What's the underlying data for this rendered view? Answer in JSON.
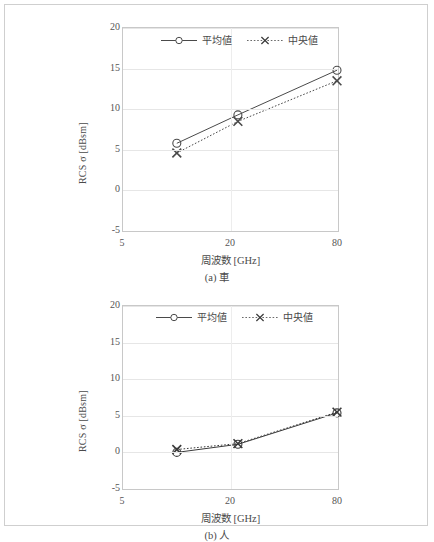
{
  "figure": {
    "panels": [
      {
        "id": "a",
        "caption": "(a) 車",
        "chart": {
          "type": "line",
          "title": "",
          "xlabel": "周波数 [GHz]",
          "ylabel": "RCS σ [dBsm]",
          "x_ticklabels": [
            "5",
            "20",
            "80"
          ],
          "x_tickvalues": [
            5,
            20,
            80
          ],
          "y_ticklabels": [
            "20",
            "15",
            "10",
            "5",
            "0",
            "-5"
          ],
          "y_tickvalues": [
            20,
            15,
            10,
            5,
            0,
            -5
          ],
          "xlim": [
            5,
            80
          ],
          "ylim": [
            -5,
            20
          ],
          "x_scale": "log",
          "grid": "horizontal",
          "legend_position": "top-center",
          "x": [
            10,
            22,
            79
          ],
          "series": [
            {
              "name": "平均値",
              "marker": "circle",
              "line": "solid",
              "color": "#4a4a4a",
              "values": [
                5.8,
                9.3,
                14.8
              ]
            },
            {
              "name": "中央値",
              "marker": "cross",
              "line": "dotted",
              "color": "#4a4a4a",
              "values": [
                4.6,
                8.5,
                13.5
              ]
            }
          ]
        }
      },
      {
        "id": "b",
        "caption": "(b) 人",
        "chart": {
          "type": "line",
          "title": "",
          "xlabel": "周波数 [GHz]",
          "ylabel": "RCS σ [dBsm]",
          "x_ticklabels": [
            "5",
            "20",
            "80"
          ],
          "x_tickvalues": [
            5,
            20,
            80
          ],
          "y_ticklabels": [
            "20",
            "15",
            "10",
            "5",
            "0",
            "-5"
          ],
          "y_tickvalues": [
            20,
            15,
            10,
            5,
            0,
            -5
          ],
          "xlim": [
            5,
            80
          ],
          "ylim": [
            -5,
            20
          ],
          "x_scale": "log",
          "grid": "horizontal",
          "legend_position": "top-center",
          "x": [
            10,
            22,
            79
          ],
          "series": [
            {
              "name": "平均値",
              "marker": "circle",
              "line": "solid",
              "color": "#3a3a3a",
              "values": [
                0.0,
                1.1,
                5.4
              ]
            },
            {
              "name": "中央値",
              "marker": "cross",
              "line": "dotted",
              "color": "#3a3a3a",
              "values": [
                0.4,
                1.2,
                5.5
              ]
            }
          ]
        }
      }
    ]
  },
  "chart_data": [
    {
      "type": "line",
      "title": "(a) 車",
      "xlabel": "周波数 [GHz]",
      "ylabel": "RCS σ [dBsm]",
      "categories": [
        "10",
        "22",
        "79"
      ],
      "x": [
        10,
        22,
        79
      ],
      "xlim": [
        5,
        80
      ],
      "ylim": [
        -5,
        20
      ],
      "xticks": [
        5,
        20,
        80
      ],
      "yticks": [
        20,
        15,
        10,
        5,
        0,
        -5
      ],
      "grid": true,
      "legend_position": "top-center",
      "series": [
        {
          "name": "平均値",
          "values": [
            5.8,
            9.3,
            14.8
          ]
        },
        {
          "name": "中央値",
          "values": [
            4.6,
            8.5,
            13.5
          ]
        }
      ]
    },
    {
      "type": "line",
      "title": "(b) 人",
      "xlabel": "周波数 [GHz]",
      "ylabel": "RCS σ [dBsm]",
      "categories": [
        "10",
        "22",
        "79"
      ],
      "x": [
        10,
        22,
        79
      ],
      "xlim": [
        5,
        80
      ],
      "ylim": [
        -5,
        20
      ],
      "xticks": [
        5,
        20,
        80
      ],
      "yticks": [
        20,
        15,
        10,
        5,
        0,
        -5
      ],
      "grid": true,
      "legend_position": "top-center",
      "series": [
        {
          "name": "平均値",
          "values": [
            0.0,
            1.1,
            5.4
          ]
        },
        {
          "name": "中央値",
          "values": [
            0.4,
            1.2,
            5.5
          ]
        }
      ]
    }
  ]
}
